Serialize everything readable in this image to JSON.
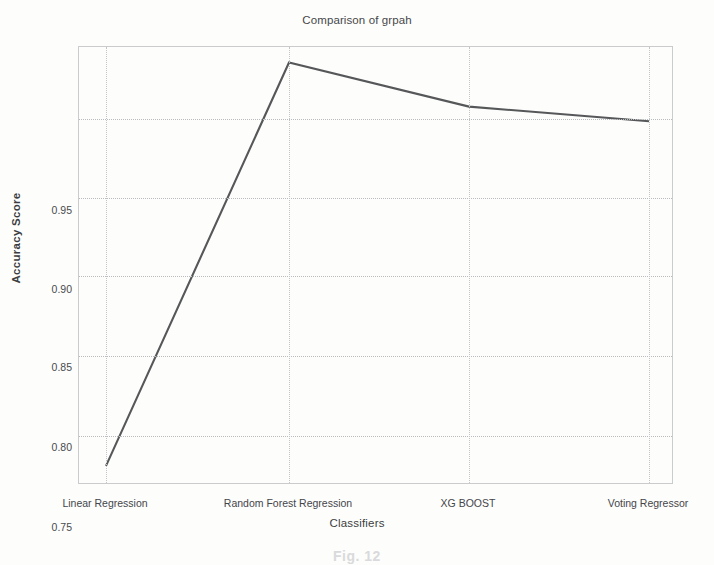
{
  "chart_data": {
    "type": "line",
    "title": "Comparison of grpah",
    "xlabel": "Classifiers",
    "ylabel": "Accuracy Score",
    "categories": [
      "Linear Regression",
      "Random Forest Regression",
      "XG BOOST",
      "Voting Regressor"
    ],
    "series": [
      {
        "name": "Accuracy Score",
        "values": [
          0.733,
          0.98,
          0.953,
          0.944
        ],
        "color": "#565759"
      }
    ],
    "ylim": [
      0.7225,
      0.9895
    ],
    "yticks": [
      0.75,
      0.8,
      0.85,
      0.9,
      0.95
    ],
    "ytick_labels": [
      "0.75",
      "0.80",
      "0.85",
      "0.90",
      "0.95"
    ],
    "grid": true,
    "grid_style": "dotted",
    "legend": "none"
  },
  "figure": {
    "caption_ghost": "Fig. 12",
    "background_color": "#fdfdfc",
    "axis_color": "#c9cbcc",
    "grid_color": "#b9bcbe",
    "text_color": "#3a3a3a"
  }
}
